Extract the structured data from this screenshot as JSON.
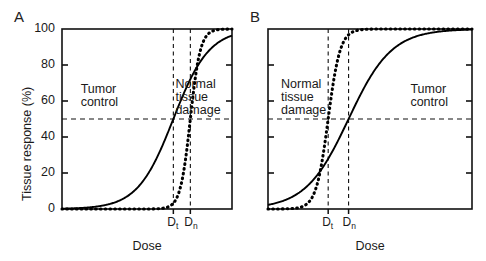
{
  "figure": {
    "panels": [
      {
        "letter": "A",
        "x_axis_label": "Dose",
        "y_axis_label": "Tissue response (%)",
        "y_ticks": [
          0,
          20,
          40,
          60,
          80,
          100
        ],
        "show_y_tick_labels": true,
        "dose_markers": [
          {
            "id": "Dt",
            "base": "D",
            "sub": "t",
            "x_frac": 0.655
          },
          {
            "id": "Dn",
            "base": "D",
            "sub": "n",
            "x_frac": 0.755
          }
        ],
        "response_reference_line": 50,
        "region_labels": [
          {
            "text": [
              "Tumor",
              "control"
            ],
            "x_frac": 0.22,
            "y_frac": 0.3
          },
          {
            "text": [
              "Normal",
              "tissue",
              "damage"
            ],
            "x_frac": 0.8,
            "y_frac": 0.27
          }
        ],
        "curves": [
          {
            "name": "tumor-control",
            "style": "solid",
            "d50_frac": 0.655,
            "slope": 9.5
          },
          {
            "name": "normal-tissue-damage",
            "style": "dotted",
            "d50_frac": 0.755,
            "slope": 34.0
          }
        ]
      },
      {
        "letter": "B",
        "x_axis_label": "Dose",
        "y_axis_label": "Tissue response (%)",
        "y_ticks": [
          0,
          20,
          40,
          60,
          80,
          100
        ],
        "show_y_tick_labels": false,
        "dose_markers": [
          {
            "id": "Dt",
            "base": "D",
            "sub": "t",
            "x_frac": 0.295
          },
          {
            "id": "Dn",
            "base": "D",
            "sub": "n",
            "x_frac": 0.395
          }
        ],
        "response_reference_line": 50,
        "region_labels": [
          {
            "text": [
              "Normal",
              "tissue",
              "damage"
            ],
            "x_frac": 0.175,
            "y_frac": 0.27
          },
          {
            "text": [
              "Tumor",
              "control"
            ],
            "x_frac": 0.79,
            "y_frac": 0.3
          }
        ],
        "curves": [
          {
            "name": "normal-tissue-damage",
            "style": "dotted",
            "d50_frac": 0.295,
            "slope": 34.0
          },
          {
            "name": "tumor-control",
            "style": "solid",
            "d50_frac": 0.395,
            "slope": 9.5
          }
        ]
      }
    ]
  },
  "chart_data": {
    "type": "line",
    "title": "",
    "xlabel": "Dose",
    "ylabel": "Tissue response (%)",
    "ylim": [
      0,
      100
    ],
    "yticks": [
      0,
      20,
      40,
      60,
      80,
      100
    ],
    "xticks_labeled": [
      "Dt",
      "Dn"
    ],
    "grid": false,
    "legend_position": "in-plot-annotations",
    "panels": [
      {
        "label": "A",
        "annotations": [
          "Tumor control",
          "Normal tissue damage"
        ],
        "reference_lines": [
          {
            "orientation": "horizontal",
            "value": 50,
            "style": "dashed"
          },
          {
            "orientation": "vertical",
            "value": "Dt",
            "style": "dashed"
          },
          {
            "orientation": "vertical",
            "value": "Dn",
            "style": "dashed"
          }
        ],
        "series": [
          {
            "name": "Tumor control",
            "style": "solid",
            "d50": "Dt",
            "x": [
              0,
              10,
              20,
              30,
              40,
              50,
              55,
              60,
              65.5,
              70,
              75,
              80,
              85,
              90,
              100
            ],
            "values": [
              0,
              0.5,
              1.5,
              4,
              9,
              25,
              33,
              42,
              50,
              62,
              76,
              87,
              94,
              97,
              100
            ]
          },
          {
            "name": "Normal tissue damage",
            "style": "dotted",
            "d50": "Dn",
            "x": [
              0,
              40,
              55,
              62,
              66,
              70,
              73,
              75.5,
              78,
              81,
              85,
              90,
              100
            ],
            "values": [
              0,
              0,
              0,
              1,
              4,
              14,
              33,
              50,
              70,
              88,
              97,
              99.5,
              100
            ]
          }
        ]
      },
      {
        "label": "B",
        "annotations": [
          "Normal tissue damage",
          "Tumor control"
        ],
        "reference_lines": [
          {
            "orientation": "horizontal",
            "value": 50,
            "style": "dashed"
          },
          {
            "orientation": "vertical",
            "value": "Dt",
            "style": "dashed"
          },
          {
            "orientation": "vertical",
            "value": "Dn",
            "style": "dashed"
          }
        ],
        "series": [
          {
            "name": "Normal tissue damage",
            "style": "dotted",
            "d50": "Dt",
            "x": [
              0,
              5,
              12,
              17,
              21,
              25,
              27.5,
              29.5,
              32,
              35,
              40,
              50,
              100
            ],
            "values": [
              0,
              0,
              0,
              1,
              4,
              14,
              33,
              50,
              70,
              88,
              97,
              99.5,
              100
            ]
          },
          {
            "name": "Tumor control",
            "style": "solid",
            "d50": "Dn",
            "x": [
              0,
              5,
              10,
              15,
              20,
              25,
              30,
              35,
              39.5,
              45,
              52,
              60,
              70,
              80,
              100
            ],
            "values": [
              0,
              0.5,
              1.5,
              4,
              9,
              18,
              28,
              40,
              50,
              66,
              81,
              91,
              97,
              99,
              100
            ]
          }
        ]
      }
    ]
  }
}
